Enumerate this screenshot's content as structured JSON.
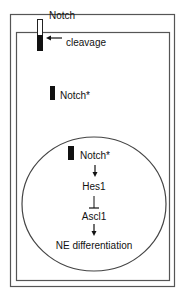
{
  "diagram": {
    "colors": {
      "stroke": "#555555",
      "ink": "#111111",
      "background": "#ffffff"
    },
    "labels": {
      "notch_receptor": "Notch",
      "cleavage": "cleavage",
      "notch_cytoplasm": "Notch*",
      "notch_nucleus": "Notch*",
      "hes1": "Hes1",
      "ascl1": "Ascl1",
      "ne_differentiation": "NE differentiation"
    },
    "nodes": [
      {
        "id": "notch",
        "label": "Notch",
        "location": "membrane"
      },
      {
        "id": "notch_star_cyto",
        "label": "Notch*",
        "location": "cytoplasm"
      },
      {
        "id": "notch_star_nuc",
        "label": "Notch*",
        "location": "nucleus"
      },
      {
        "id": "hes1",
        "label": "Hes1",
        "location": "nucleus"
      },
      {
        "id": "ascl1",
        "label": "Ascl1",
        "location": "nucleus"
      },
      {
        "id": "ne_diff",
        "label": "NE differentiation",
        "location": "nucleus"
      }
    ],
    "edges": [
      {
        "from": "cleavage",
        "to": "notch",
        "type": "arrow",
        "label": "cleavage"
      },
      {
        "from": "notch_star_nuc",
        "to": "hes1",
        "type": "activates"
      },
      {
        "from": "hes1",
        "to": "ascl1",
        "type": "inhibits"
      },
      {
        "from": "ascl1",
        "to": "ne_diff",
        "type": "activates"
      }
    ]
  }
}
